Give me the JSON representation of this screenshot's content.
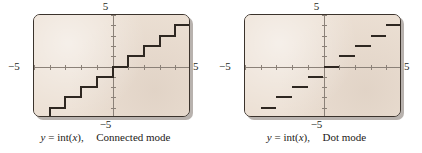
{
  "figure": {
    "background": "#ffffff",
    "screen_background": "#ece0d4",
    "curve_color": "#2e2721",
    "axis_color": "#8b8178",
    "frame_color": "#3b332c"
  },
  "panels": [
    {
      "id": "connected",
      "caption": {
        "y_var": "y",
        "equals": "=",
        "func": "int(",
        "arg": "x",
        "close": "),",
        "mode": "Connected mode",
        "full": "y = int(x),  Connected mode"
      },
      "labels": {
        "top": "5",
        "bottom": "−5",
        "left": "−5",
        "right": "5"
      }
    },
    {
      "id": "dot",
      "caption": {
        "y_var": "y",
        "equals": "=",
        "func": "int(",
        "arg": "x",
        "close": "),",
        "mode": "Dot mode",
        "full": "y = int(x),  Dot mode"
      },
      "labels": {
        "top": "5",
        "bottom": "−5",
        "left": "−5",
        "right": "5"
      }
    }
  ],
  "chart_data": [
    {
      "type": "line",
      "id": "connected",
      "title": "y = int(x),  Connected mode",
      "xlabel": "x",
      "ylabel": "y",
      "xlim": [
        -5,
        5
      ],
      "ylim": [
        -5,
        5
      ],
      "xticks": [
        -5,
        -4,
        -3,
        -2,
        -1,
        0,
        1,
        2,
        3,
        4,
        5
      ],
      "yticks": [
        -5,
        -4,
        -3,
        -2,
        -1,
        0,
        1,
        2,
        3,
        4,
        5
      ],
      "grid": false,
      "legend": "none",
      "function": "y = int(x)",
      "note": "Greatest integer (floor) step function drawn with vertical connecting segments at each integer jump.",
      "steps": [
        {
          "x_start": -5,
          "x_end": -4,
          "y": -5
        },
        {
          "x_start": -4,
          "x_end": -3,
          "y": -4
        },
        {
          "x_start": -3,
          "x_end": -2,
          "y": -3
        },
        {
          "x_start": -2,
          "x_end": -1,
          "y": -2
        },
        {
          "x_start": -1,
          "x_end": 0,
          "y": -1
        },
        {
          "x_start": 0,
          "x_end": 1,
          "y": 0
        },
        {
          "x_start": 1,
          "x_end": 2,
          "y": 1
        },
        {
          "x_start": 2,
          "x_end": 3,
          "y": 2
        },
        {
          "x_start": 3,
          "x_end": 4,
          "y": 3
        },
        {
          "x_start": 4,
          "x_end": 5,
          "y": 4
        }
      ],
      "connectors": [
        {
          "x": -4,
          "y_from": -5,
          "y_to": -4
        },
        {
          "x": -3,
          "y_from": -4,
          "y_to": -3
        },
        {
          "x": -2,
          "y_from": -3,
          "y_to": -2
        },
        {
          "x": -1,
          "y_from": -2,
          "y_to": -1
        },
        {
          "x": 0,
          "y_from": -1,
          "y_to": 0
        },
        {
          "x": 1,
          "y_from": 0,
          "y_to": 1
        },
        {
          "x": 2,
          "y_from": 1,
          "y_to": 2
        },
        {
          "x": 3,
          "y_from": 2,
          "y_to": 3
        },
        {
          "x": 4,
          "y_from": 3,
          "y_to": 4
        }
      ]
    },
    {
      "type": "line",
      "id": "dot",
      "title": "y = int(x),  Dot mode",
      "xlabel": "x",
      "ylabel": "y",
      "xlim": [
        -5,
        5
      ],
      "ylim": [
        -5,
        5
      ],
      "xticks": [
        -5,
        -4,
        -3,
        -2,
        -1,
        0,
        1,
        2,
        3,
        4,
        5
      ],
      "yticks": [
        -5,
        -4,
        -3,
        -2,
        -1,
        0,
        1,
        2,
        3,
        4,
        5
      ],
      "grid": false,
      "legend": "none",
      "function": "y = int(x)",
      "note": "Greatest integer (floor) step function drawn as separate horizontal segments with no vertical connectors.",
      "steps": [
        {
          "x_start": -5,
          "x_end": -4,
          "y": -5
        },
        {
          "x_start": -4,
          "x_end": -3,
          "y": -4
        },
        {
          "x_start": -3,
          "x_end": -2,
          "y": -3
        },
        {
          "x_start": -2,
          "x_end": -1,
          "y": -2
        },
        {
          "x_start": -1,
          "x_end": 0,
          "y": -1
        },
        {
          "x_start": 0,
          "x_end": 1,
          "y": 0
        },
        {
          "x_start": 1,
          "x_end": 2,
          "y": 1
        },
        {
          "x_start": 2,
          "x_end": 3,
          "y": 2
        },
        {
          "x_start": 3,
          "x_end": 4,
          "y": 3
        },
        {
          "x_start": 4,
          "x_end": 5,
          "y": 4
        }
      ],
      "connectors": []
    }
  ]
}
